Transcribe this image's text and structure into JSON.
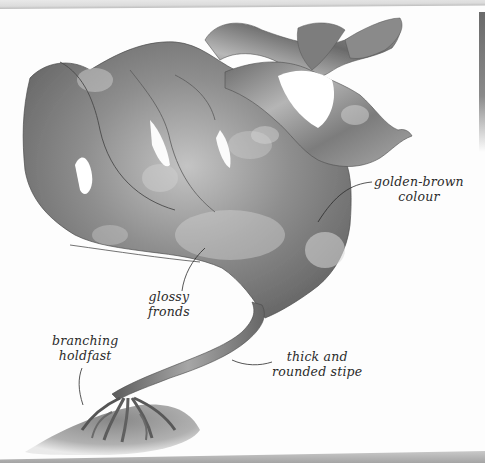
{
  "figure": {
    "palette": {
      "paper": "#fdfdfd",
      "frond_dark": "#5e5e5e",
      "frond_mid": "#8c8c8c",
      "frond_light": "#c8c8c8",
      "ink": "#2b2b2b"
    }
  },
  "labels": [
    {
      "id": "golden-brown-colour",
      "lines": [
        "golden-brown",
        "colour"
      ]
    },
    {
      "id": "glossy-fronds",
      "lines": [
        "glossy",
        "fronds"
      ]
    },
    {
      "id": "branching-holdfast",
      "lines": [
        "branching",
        "holdfast"
      ]
    },
    {
      "id": "thick-rounded-stipe",
      "lines": [
        "thick and",
        "rounded stipe"
      ]
    }
  ]
}
